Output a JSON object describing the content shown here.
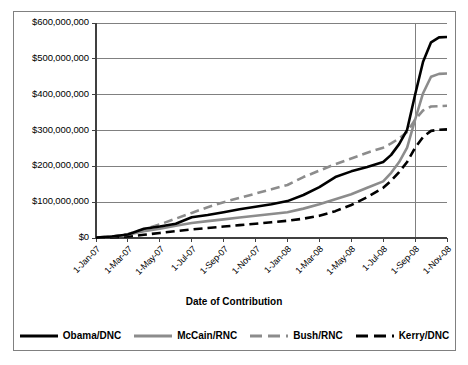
{
  "chart_data": {
    "type": "line",
    "title": "",
    "xlabel": "Date of Contribution",
    "ylabel": "",
    "ylim": [
      0,
      600000000
    ],
    "grid": true,
    "legend_position": "bottom",
    "y_ticks": [
      0,
      100000000,
      200000000,
      300000000,
      400000000,
      500000000,
      600000000
    ],
    "y_tick_labels": [
      "$0",
      "$100,000,000",
      "$200,000,000",
      "$300,000,000",
      "$400,000,000",
      "$500,000,000",
      "$600,000,000"
    ],
    "x": [
      "1-Jan-07",
      "1-Mar-07",
      "1-May-07",
      "1-Jul-07",
      "1-Sep-07",
      "1-Nov-07",
      "1-Jan-08",
      "1-Mar-08",
      "1-May-08",
      "1-Jul-08",
      "1-Sep-08",
      "1-Nov-08"
    ],
    "annotations": [
      {
        "type": "vertical-line",
        "at": "1-Sep-08",
        "label": ""
      }
    ],
    "series": [
      {
        "name": "Obama/DNC",
        "color": "#000000",
        "style": "solid",
        "width": 2.6,
        "values": [
          1000000,
          10000000,
          32000000,
          58000000,
          72000000,
          87000000,
          103000000,
          142000000,
          186000000,
          212000000,
          302000000,
          560000000
        ],
        "dense_x": [
          0,
          0.5,
          1,
          1.5,
          2,
          2.5,
          3,
          3.5,
          4,
          4.5,
          5,
          5.5,
          6,
          6.5,
          7,
          7.5,
          8,
          8.5,
          9,
          9.25,
          9.5,
          9.75,
          10,
          10.25,
          10.5,
          10.75,
          11
        ],
        "dense_y": [
          1000000,
          4000000,
          10000000,
          26000000,
          32000000,
          40000000,
          58000000,
          64000000,
          72000000,
          80000000,
          87000000,
          94000000,
          103000000,
          120000000,
          142000000,
          170000000,
          186000000,
          198000000,
          212000000,
          232000000,
          262000000,
          302000000,
          400000000,
          492000000,
          546000000,
          560000000,
          561000000
        ]
      },
      {
        "name": "McCain/RNC",
        "color": "#8c8c8c",
        "style": "solid",
        "width": 2.6,
        "values": [
          1000000,
          9000000,
          26000000,
          42000000,
          52000000,
          62000000,
          72000000,
          94000000,
          122000000,
          158000000,
          252000000,
          458000000
        ],
        "dense_x": [
          0,
          0.5,
          1,
          1.5,
          2,
          2.5,
          3,
          3.5,
          4,
          4.5,
          5,
          5.5,
          6,
          6.5,
          7,
          7.5,
          8,
          8.5,
          9,
          9.25,
          9.5,
          9.75,
          10,
          10.25,
          10.5,
          10.75,
          11
        ],
        "dense_y": [
          1000000,
          4000000,
          9000000,
          19000000,
          26000000,
          34000000,
          42000000,
          47000000,
          52000000,
          57000000,
          62000000,
          67000000,
          72000000,
          82000000,
          94000000,
          108000000,
          122000000,
          140000000,
          158000000,
          182000000,
          212000000,
          252000000,
          330000000,
          404000000,
          450000000,
          458000000,
          459000000
        ]
      },
      {
        "name": "Bush/RNC",
        "color": "#8c8c8c",
        "style": "dashed",
        "width": 2.6,
        "values": [
          1000000,
          11000000,
          38000000,
          70000000,
          100000000,
          124000000,
          148000000,
          188000000,
          222000000,
          252000000,
          296000000,
          368000000
        ],
        "dense_x": [
          0,
          0.5,
          1,
          1.5,
          2,
          2.5,
          3,
          3.5,
          4,
          4.5,
          5,
          5.5,
          6,
          6.5,
          7,
          7.5,
          8,
          8.5,
          9,
          9.25,
          9.5,
          9.75,
          10,
          10.25,
          10.5,
          10.75,
          11
        ],
        "dense_y": [
          1000000,
          4000000,
          11000000,
          24000000,
          38000000,
          54000000,
          70000000,
          86000000,
          100000000,
          112000000,
          124000000,
          136000000,
          148000000,
          170000000,
          188000000,
          206000000,
          222000000,
          238000000,
          252000000,
          264000000,
          278000000,
          296000000,
          330000000,
          356000000,
          367000000,
          368000000,
          369000000
        ]
      },
      {
        "name": "Kerry/DNC",
        "color": "#000000",
        "style": "dashed",
        "width": 2.6,
        "values": [
          1000000,
          4000000,
          14000000,
          24000000,
          32000000,
          40000000,
          48000000,
          62000000,
          92000000,
          140000000,
          212000000,
          302000000
        ],
        "dense_x": [
          0,
          0.5,
          1,
          1.5,
          2,
          2.5,
          3,
          3.5,
          4,
          4.5,
          5,
          5.5,
          6,
          6.5,
          7,
          7.5,
          8,
          8.5,
          9,
          9.25,
          9.5,
          9.75,
          10,
          10.25,
          10.5,
          10.75,
          11
        ],
        "dense_y": [
          1000000,
          2000000,
          4000000,
          9000000,
          14000000,
          19000000,
          24000000,
          28000000,
          32000000,
          36000000,
          40000000,
          44000000,
          48000000,
          54000000,
          62000000,
          75000000,
          92000000,
          114000000,
          140000000,
          160000000,
          184000000,
          212000000,
          252000000,
          282000000,
          299000000,
          302000000,
          303000000
        ]
      }
    ]
  },
  "legend": {
    "entries": [
      {
        "label": "Obama/DNC"
      },
      {
        "label": "McCain/RNC"
      },
      {
        "label": "Bush/RNC"
      },
      {
        "label": "Kerry/DNC"
      }
    ]
  }
}
